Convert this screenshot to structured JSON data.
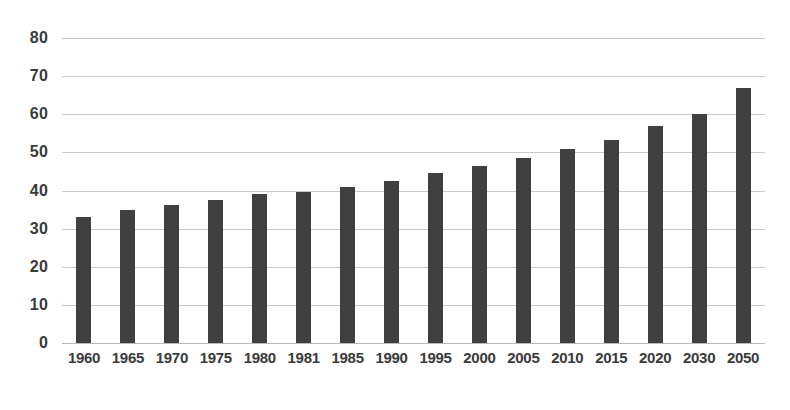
{
  "chart_data": {
    "type": "bar",
    "title": "",
    "subtitle": "",
    "xlabel": "",
    "ylabel": "",
    "categories": [
      "1960",
      "1965",
      "1970",
      "1975",
      "1980",
      "1981",
      "1985",
      "1990",
      "1995",
      "2000",
      "2005",
      "2010",
      "2015",
      "2020",
      "2030",
      "2050"
    ],
    "values": [
      33,
      35,
      36.3,
      37.5,
      39,
      39.5,
      41,
      42.5,
      44.5,
      46.3,
      48.5,
      51,
      53.3,
      57,
      60,
      67
    ],
    "series": [
      {
        "name": "",
        "values": [
          33,
          35,
          36.3,
          37.5,
          39,
          39.5,
          41,
          42.5,
          44.5,
          46.3,
          48.5,
          51,
          53.3,
          57,
          60,
          67
        ]
      }
    ],
    "ylim": [
      0,
      80
    ],
    "yticks": [
      0,
      10,
      20,
      30,
      40,
      50,
      60,
      70,
      80
    ],
    "ytick_labels": [
      "0",
      "10",
      "20",
      "30",
      "40",
      "50",
      "60",
      "70",
      "80"
    ],
    "grid": true,
    "grid_axis": "y",
    "legend": false,
    "legend_position": "none",
    "bar_color": "#404040",
    "grid_color": "#c9c9c9",
    "axis_text_color": "#3a3a3a",
    "background_color": "#ffffff",
    "annotations": []
  }
}
